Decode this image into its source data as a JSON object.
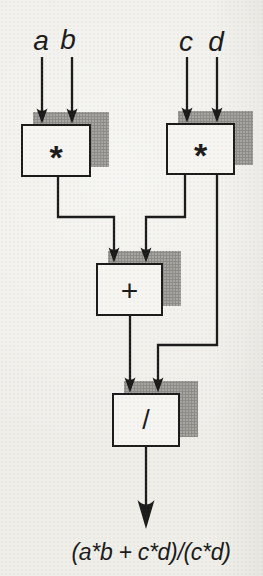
{
  "diagram": {
    "type": "dataflow",
    "inputs": [
      {
        "label": "a"
      },
      {
        "label": "b"
      },
      {
        "label": "c"
      },
      {
        "label": "d"
      }
    ],
    "operators": [
      {
        "id": "multiply-left",
        "symbol": "*",
        "inputs": [
          "a",
          "b"
        ],
        "output": "a*b"
      },
      {
        "id": "multiply-right",
        "symbol": "*",
        "inputs": [
          "c",
          "d"
        ],
        "output": "c*d"
      },
      {
        "id": "add",
        "symbol": "+",
        "inputs": [
          "a*b",
          "c*d"
        ],
        "output": "a*b + c*d"
      },
      {
        "id": "divide",
        "symbol": "/",
        "inputs": [
          "a*b + c*d",
          "c*d"
        ],
        "output": "(a*b + c*d)/(c*d)"
      }
    ],
    "connections": [
      {
        "from": "a",
        "to": "multiply-left"
      },
      {
        "from": "b",
        "to": "multiply-left"
      },
      {
        "from": "c",
        "to": "multiply-right"
      },
      {
        "from": "d",
        "to": "multiply-right"
      },
      {
        "from": "multiply-left",
        "to": "add"
      },
      {
        "from": "multiply-right",
        "to": "add"
      },
      {
        "from": "multiply-right",
        "to": "divide"
      },
      {
        "from": "add",
        "to": "divide"
      },
      {
        "from": "divide",
        "to": "result"
      }
    ],
    "result_label": "(a*b + c*d)/(c*d)",
    "colors": {
      "ink": "#1b1b1b",
      "paper": "#efeee9",
      "box_fill": "#f6f5f1",
      "shadow_dots": "#8e8c88"
    }
  }
}
